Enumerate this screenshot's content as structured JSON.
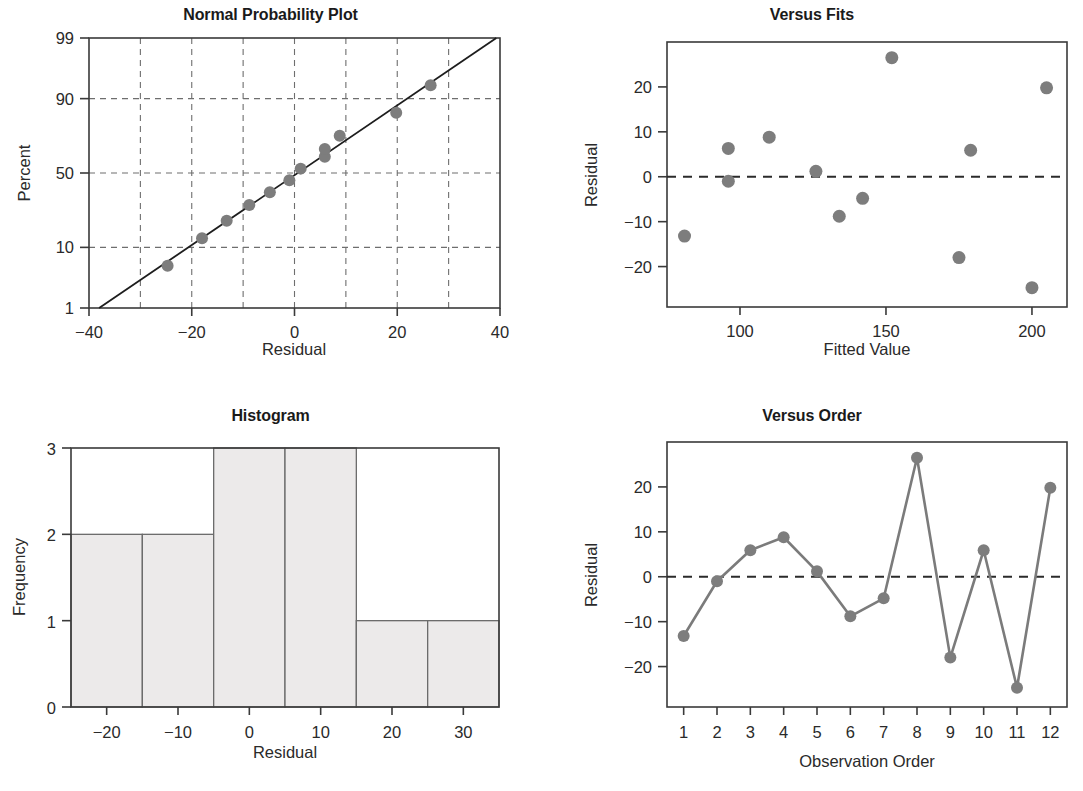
{
  "figure": {
    "kind": "four-in-one residual plots",
    "marker_color": "#7d7d7d",
    "line_color": "#1d1d1d",
    "bar_fill": "#eceaea",
    "bar_stroke": "#6b6b6b",
    "grid_color": "#6e6e6e",
    "background": "#ffffff"
  },
  "residuals": [
    -13.2,
    -1.0,
    5.9,
    8.8,
    1.2,
    -8.8,
    -4.8,
    26.5,
    -18.0,
    5.9,
    -24.7,
    19.8
  ],
  "panels": {
    "normal": {
      "title": "Normal Probability Plot"
    },
    "fits": {
      "title": "Versus Fits"
    },
    "histogram": {
      "title": "Histogram"
    },
    "order": {
      "title": "Versus Order"
    }
  },
  "chart_data": [
    {
      "type": "scatter",
      "title": "Normal Probability Plot",
      "xlabel": "Residual",
      "ylabel": "Percent",
      "xlim": [
        -40,
        40
      ],
      "xticks": [
        -40,
        -20,
        0,
        20,
        40
      ],
      "xticklabels": [
        "-40",
        "-20",
        "0",
        "20",
        "40"
      ],
      "yscale": "normal-probability",
      "ylim": [
        1,
        99
      ],
      "yticks": [
        1,
        10,
        50,
        90,
        99
      ],
      "yticklabels": [
        "1",
        "10",
        "50",
        "90",
        "99"
      ],
      "grid": true,
      "legend": "none",
      "x": [
        -24.7,
        -18.0,
        -13.2,
        -8.8,
        -4.8,
        -1.0,
        1.2,
        5.9,
        5.9,
        8.8,
        19.8,
        26.5
      ],
      "y": [
        5.5,
        13.0,
        20.5,
        29.0,
        37.0,
        45.0,
        53.0,
        61.0,
        66.0,
        74.0,
        85.0,
        93.5
      ],
      "annotations": [
        "fitted straight reference line through points"
      ]
    },
    {
      "type": "scatter",
      "title": "Versus Fits",
      "xlabel": "Fitted Value",
      "ylabel": "Residual",
      "xlim": [
        75,
        212
      ],
      "xticks": [
        100,
        150,
        200
      ],
      "xticklabels": [
        "100",
        "150",
        "200"
      ],
      "ylim": [
        -29,
        30
      ],
      "yticks": [
        -20,
        -10,
        0,
        10,
        20
      ],
      "yticklabels": [
        "-20",
        "-10",
        "0",
        "10",
        "20"
      ],
      "grid": false,
      "legend": "none",
      "x": [
        81,
        96,
        96,
        110,
        126,
        134,
        142,
        152,
        175,
        179,
        200,
        205
      ],
      "y": [
        -13.2,
        -1.0,
        6.3,
        8.8,
        1.2,
        -8.8,
        -4.8,
        26.5,
        -18.0,
        5.9,
        -24.7,
        19.8
      ],
      "annotations": [
        "horizontal dashed reference line at y = 0"
      ]
    },
    {
      "type": "bar",
      "title": "Histogram",
      "xlabel": "Residual",
      "ylabel": "Frequency",
      "xlim": [
        -25,
        35
      ],
      "xticks": [
        -20,
        -10,
        0,
        10,
        20,
        30
      ],
      "xticklabels": [
        "-20",
        "-10",
        "0",
        "10",
        "20",
        "30"
      ],
      "ylim": [
        0,
        3
      ],
      "yticks": [
        0,
        1,
        2,
        3
      ],
      "yticklabels": [
        "0",
        "1",
        "2",
        "3"
      ],
      "grid": false,
      "legend": "none",
      "bin_edges": [
        -25,
        -15,
        -5,
        5,
        15,
        25,
        35
      ],
      "categories": [
        "-25 to -15",
        "-15 to -5",
        "-5 to 5",
        "5 to 15",
        "15 to 25",
        "25 to 35"
      ],
      "values": [
        2,
        2,
        3,
        3,
        1,
        1
      ]
    },
    {
      "type": "line",
      "title": "Versus Order",
      "xlabel": "Observation Order",
      "ylabel": "Residual",
      "xlim": [
        0.5,
        12.5
      ],
      "xticks": [
        1,
        2,
        3,
        4,
        5,
        6,
        7,
        8,
        9,
        10,
        11,
        12
      ],
      "xticklabels": [
        "1",
        "2",
        "3",
        "4",
        "5",
        "6",
        "7",
        "8",
        "9",
        "10",
        "11",
        "12"
      ],
      "ylim": [
        -29,
        30
      ],
      "yticks": [
        -20,
        -10,
        0,
        10,
        20
      ],
      "yticklabels": [
        "-20",
        "-10",
        "0",
        "10",
        "20"
      ],
      "grid": false,
      "legend": "none",
      "x": [
        1,
        2,
        3,
        4,
        5,
        6,
        7,
        8,
        9,
        10,
        11,
        12
      ],
      "values": [
        -13.2,
        -1.0,
        5.9,
        8.8,
        1.2,
        -8.8,
        -4.8,
        26.5,
        -18.0,
        5.9,
        -24.7,
        19.8
      ],
      "annotations": [
        "horizontal dashed reference line at y = 0",
        "points connected in observation order"
      ]
    }
  ]
}
